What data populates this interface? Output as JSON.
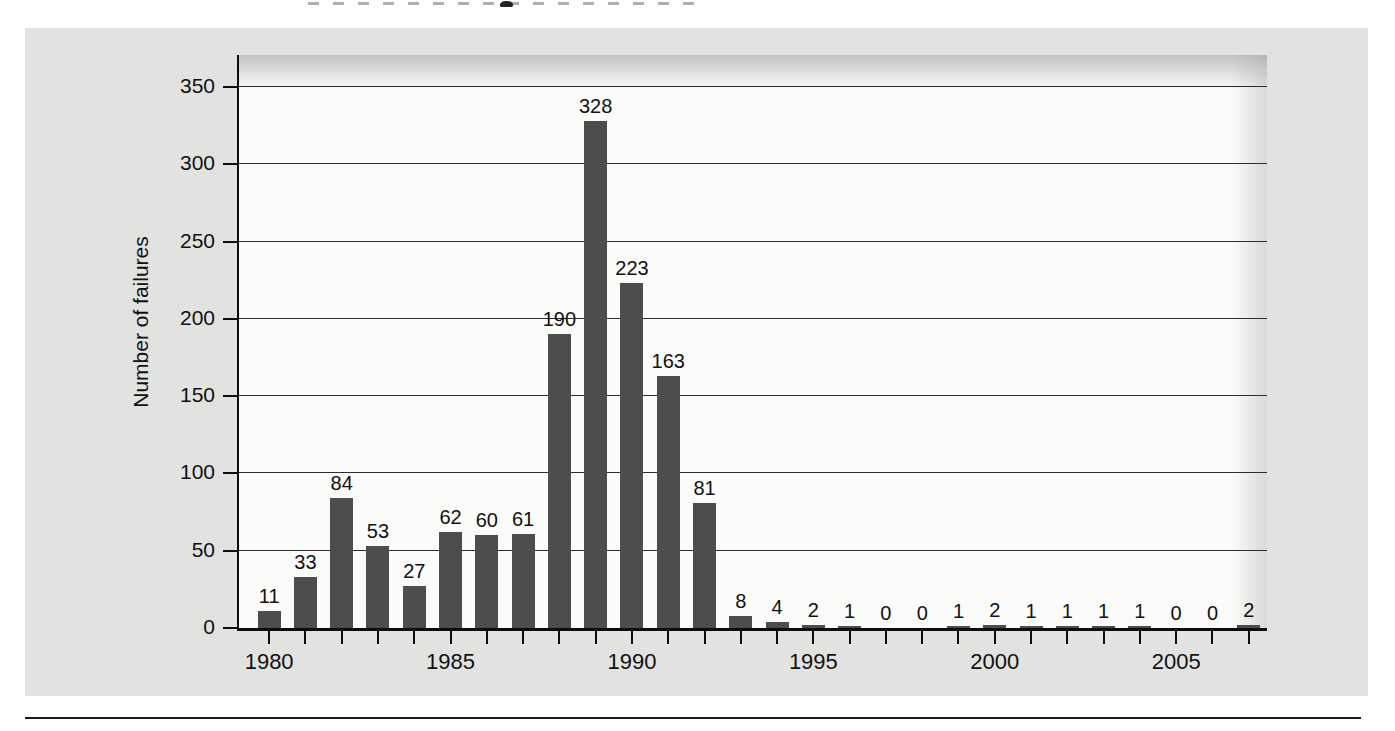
{
  "page": {
    "background": "#ffffff",
    "panel_color": "#e2e2e0",
    "bottom_rule_color": "#1c1c1c",
    "cropped_title_visible": true
  },
  "chart_data": {
    "type": "bar",
    "title": "",
    "xlabel": "",
    "ylabel": "Number of failures",
    "categories": [
      1980,
      1981,
      1982,
      1983,
      1984,
      1985,
      1986,
      1987,
      1988,
      1989,
      1990,
      1991,
      1992,
      1993,
      1994,
      1995,
      1996,
      1997,
      1998,
      1999,
      2000,
      2001,
      2002,
      2003,
      2004,
      2005,
      2006,
      2007
    ],
    "values": [
      11,
      33,
      84,
      53,
      27,
      62,
      60,
      61,
      190,
      328,
      223,
      163,
      81,
      8,
      4,
      2,
      1,
      0,
      0,
      1,
      2,
      1,
      1,
      1,
      1,
      0,
      0,
      2
    ],
    "value_labels_shown": true,
    "ylim": [
      0,
      350
    ],
    "yticks": [
      0,
      50,
      100,
      150,
      200,
      250,
      300,
      350
    ],
    "xtick_labeled_years": [
      "1980",
      "1985",
      "1990",
      "1995",
      "2000",
      "2005"
    ],
    "xtick_labeled_indices": [
      0,
      5,
      10,
      15,
      20,
      25
    ],
    "grid": true,
    "legend": "none",
    "bar_color": "#4d4d4d",
    "plot_bg": "#fbfbf9",
    "gridline_color": "#2e2e2e"
  }
}
